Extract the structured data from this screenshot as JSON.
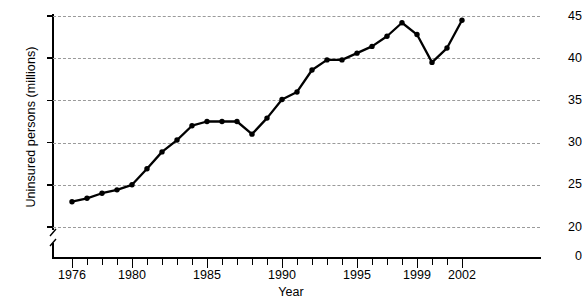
{
  "chart_data": {
    "type": "line",
    "title": "",
    "xlabel": "Year",
    "ylabel": "Uninsured persons (millions)",
    "x": [
      1976,
      1977,
      1978,
      1979,
      1980,
      1981,
      1982,
      1983,
      1984,
      1985,
      1986,
      1987,
      1988,
      1989,
      1990,
      1991,
      1992,
      1993,
      1994,
      1995,
      1996,
      1997,
      1998,
      1999,
      2000,
      2001,
      2002
    ],
    "values": [
      23.0,
      23.4,
      24.0,
      24.4,
      25.0,
      26.9,
      28.9,
      30.3,
      32.0,
      32.5,
      32.5,
      32.5,
      31.0,
      32.9,
      35.1,
      36.0,
      38.6,
      39.8,
      39.8,
      40.6,
      41.4,
      42.6,
      44.2,
      42.8,
      39.5,
      41.2,
      44.5
    ],
    "series": [
      {
        "name": "Uninsured persons",
        "values": [
          23.0,
          23.4,
          24.0,
          24.4,
          25.0,
          26.9,
          28.9,
          30.3,
          32.0,
          32.5,
          32.5,
          32.5,
          31.0,
          32.9,
          35.1,
          36.0,
          38.6,
          39.8,
          39.8,
          40.6,
          41.4,
          42.6,
          44.2,
          42.8,
          39.5,
          41.2,
          44.5
        ]
      }
    ],
    "ylim": [
      20,
      45
    ],
    "xlim": [
      1975.4,
      2002.8
    ],
    "ytick_values": [
      20,
      25,
      30,
      35,
      40,
      45
    ],
    "ytick_labels": [
      "20",
      "25",
      "30",
      "35",
      "40",
      "45"
    ],
    "y_origin_label": "0",
    "y_axis_break": true,
    "xtick_values": [
      1976,
      1977,
      1978,
      1979,
      1980,
      1981,
      1982,
      1983,
      1984,
      1985,
      1986,
      1987,
      1988,
      1989,
      1990,
      1991,
      1992,
      1993,
      1994,
      1995,
      1996,
      1997,
      1998,
      1999,
      2000,
      2001,
      2002
    ],
    "xtick_labeled": [
      {
        "year": 1976,
        "label": "1976"
      },
      {
        "year": 1980,
        "label": "1980"
      },
      {
        "year": 1985,
        "label": "1985"
      },
      {
        "year": 1990,
        "label": "1990"
      },
      {
        "year": 1995,
        "label": "1995"
      },
      {
        "year": 1999,
        "label": "1999"
      },
      {
        "year": 2002,
        "label": "2002"
      }
    ],
    "grid": "horizontal-dashed",
    "legend": "none",
    "line_color": "#000000",
    "marker": "circle",
    "marker_color": "#000000",
    "grid_color": "#9a9a9a",
    "background": "#ffffff"
  }
}
